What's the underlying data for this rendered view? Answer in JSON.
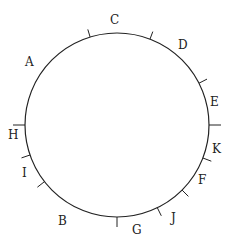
{
  "diagram": {
    "type": "circle-with-tick-marks-and-labels",
    "stroke_color": "#222222",
    "labels": [
      {
        "id": "A",
        "text": "A"
      },
      {
        "id": "C",
        "text": "C"
      },
      {
        "id": "D",
        "text": "D"
      },
      {
        "id": "E",
        "text": "E"
      },
      {
        "id": "K",
        "text": "K"
      },
      {
        "id": "F",
        "text": "F"
      },
      {
        "id": "J",
        "text": "J"
      },
      {
        "id": "G",
        "text": "G"
      },
      {
        "id": "B",
        "text": "B"
      },
      {
        "id": "I",
        "text": "I"
      },
      {
        "id": "H",
        "text": "H"
      }
    ],
    "tick_count": 11
  }
}
